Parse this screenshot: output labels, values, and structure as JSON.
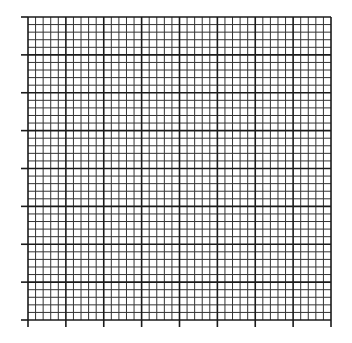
{
  "grid": {
    "left": 28,
    "top": 17,
    "right": 331,
    "bottom": 320,
    "major_divisions_x": 8,
    "major_divisions_y": 8,
    "minor_per_major": 5,
    "tick_length": 7,
    "colors": {
      "background": "#ffffff",
      "minor_line": "#333333",
      "major_line": "#1a1a1a",
      "tick": "#1a1a1a"
    }
  }
}
